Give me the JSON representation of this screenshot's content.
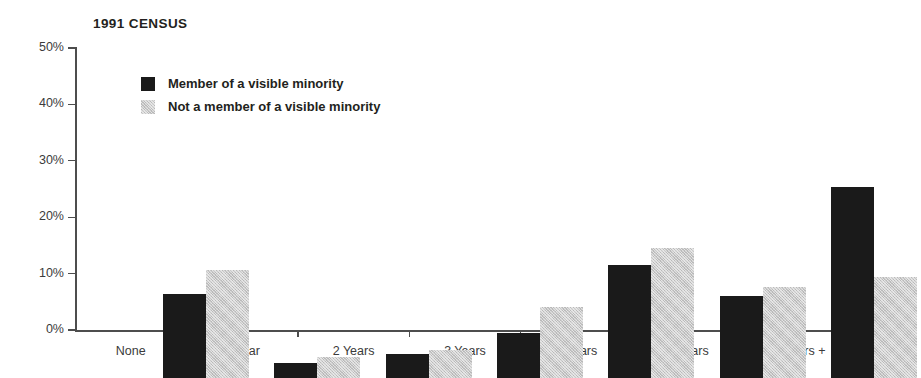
{
  "chart_data": {
    "type": "bar",
    "title": "1991 CENSUS",
    "xlabel": "",
    "ylabel": "",
    "ylim": [
      0,
      50
    ],
    "ytick_values": [
      0,
      10,
      20,
      30,
      40,
      50
    ],
    "ytick_labels": [
      "0%",
      "10%",
      "20%",
      "30%",
      "40%",
      "50%"
    ],
    "grid": false,
    "legend_position": "top-left-inside",
    "categories": [
      "None",
      "1 Year",
      "2 Years",
      "3 Years",
      "4 Years",
      "5 Years",
      "6 Years +"
    ],
    "series": [
      {
        "name": "Member of a visible minority",
        "color": "#1a1a1a",
        "values": [
          14.9,
          2.7,
          4.2,
          8.0,
          20.1,
          14.6,
          33.9
        ]
      },
      {
        "name": "Not a member of a visible minority",
        "color": "#c9c9c9",
        "values": [
          19.2,
          3.7,
          5.0,
          12.6,
          23.0,
          16.1,
          17.9
        ]
      }
    ]
  }
}
